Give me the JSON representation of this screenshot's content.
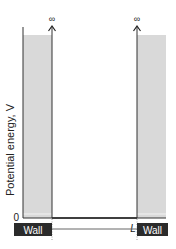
{
  "diagram": {
    "y_axis_label": "Potential energy, V",
    "y_axis_label_italic_part": "V",
    "y_zero_label": "0",
    "x_axis_label": "x",
    "x_tick_zero": "0",
    "x_tick_L": "L",
    "infinity_left": "∞",
    "infinity_right": "∞",
    "wall_left_label": "Wall",
    "wall_right_label": "Wall",
    "colors": {
      "wall_fill": "#d9d9d9",
      "axis": "#222222",
      "wall_box": "#2b2b2b"
    }
  }
}
